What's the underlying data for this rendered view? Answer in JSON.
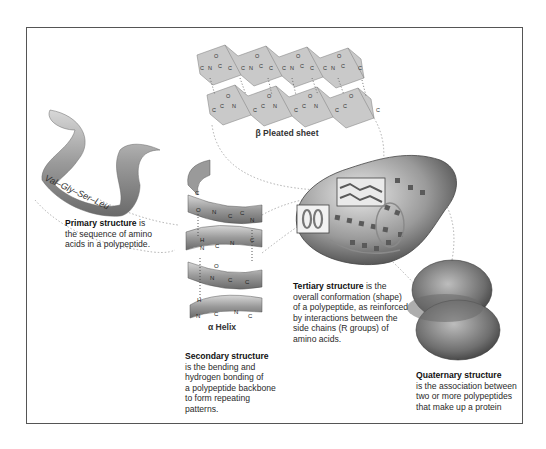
{
  "figure": {
    "colors": {
      "ribbon": "#8a8a8a",
      "sheet": "#c8c8c8",
      "protein": "#7a7a7a",
      "frame": "#555555",
      "dotted": "#999999"
    }
  },
  "beta_sheet": {
    "label": "β Pleated sheet",
    "atoms": [
      "C",
      "N",
      "C",
      "O",
      "H"
    ]
  },
  "alpha_helix": {
    "label": "α Helix",
    "atoms": [
      "C",
      "N",
      "O",
      "H"
    ]
  },
  "primary": {
    "sequence": "Val–Gly–Ser–Leu",
    "title": "Primary structure",
    "text_lines": [
      " is",
      "the sequence of amino",
      "acids in a polypeptide."
    ]
  },
  "secondary": {
    "title": "Secondary structure",
    "text_lines": [
      "is the bending and",
      "hydrogen bonding of",
      "a polypeptide backbone",
      "to form repeating",
      "patterns."
    ]
  },
  "tertiary": {
    "title": "Tertiary structure",
    "text_lines": [
      " is the",
      "overall conformation (shape)",
      "of a polypeptide, as reinforced",
      "by interactions between the",
      "side chains (R groups) of",
      "amino acids."
    ]
  },
  "quaternary": {
    "title": "Quaternary structure",
    "text_lines": [
      "is the association between",
      "two or more polypeptides",
      "that make up a protein"
    ]
  }
}
